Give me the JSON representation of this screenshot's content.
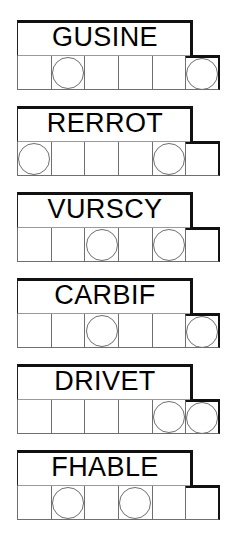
{
  "sheet": {
    "title": "word-scramble-worksheet",
    "row_count": 6,
    "cells_per_row": 6,
    "banner_cell_span": 5,
    "ink_color": "#111111",
    "grid_line_color": "#6f6f6f",
    "paper_color": "#ffffff"
  },
  "rows": [
    {
      "id": "row-1",
      "word": "GUSINE",
      "circled_positions": [
        2,
        6
      ],
      "cells": [
        {
          "index": 1,
          "circled": false
        },
        {
          "index": 2,
          "circled": true
        },
        {
          "index": 3,
          "circled": false
        },
        {
          "index": 4,
          "circled": false
        },
        {
          "index": 5,
          "circled": false
        },
        {
          "index": 6,
          "circled": true
        }
      ]
    },
    {
      "id": "row-2",
      "word": "RERROT",
      "circled_positions": [
        1,
        5
      ],
      "cells": [
        {
          "index": 1,
          "circled": true
        },
        {
          "index": 2,
          "circled": false
        },
        {
          "index": 3,
          "circled": false
        },
        {
          "index": 4,
          "circled": false
        },
        {
          "index": 5,
          "circled": true
        },
        {
          "index": 6,
          "circled": false
        }
      ]
    },
    {
      "id": "row-3",
      "word": "VURSCY",
      "circled_positions": [
        3,
        5
      ],
      "cells": [
        {
          "index": 1,
          "circled": false
        },
        {
          "index": 2,
          "circled": false
        },
        {
          "index": 3,
          "circled": true
        },
        {
          "index": 4,
          "circled": false
        },
        {
          "index": 5,
          "circled": true
        },
        {
          "index": 6,
          "circled": false
        }
      ]
    },
    {
      "id": "row-4",
      "word": "CARBIF",
      "circled_positions": [
        3,
        6
      ],
      "cells": [
        {
          "index": 1,
          "circled": false
        },
        {
          "index": 2,
          "circled": false
        },
        {
          "index": 3,
          "circled": true
        },
        {
          "index": 4,
          "circled": false
        },
        {
          "index": 5,
          "circled": false
        },
        {
          "index": 6,
          "circled": true
        }
      ]
    },
    {
      "id": "row-5",
      "word": "DRIVET",
      "circled_positions": [
        5,
        6
      ],
      "cells": [
        {
          "index": 1,
          "circled": false
        },
        {
          "index": 2,
          "circled": false
        },
        {
          "index": 3,
          "circled": false
        },
        {
          "index": 4,
          "circled": false
        },
        {
          "index": 5,
          "circled": true
        },
        {
          "index": 6,
          "circled": true
        }
      ]
    },
    {
      "id": "row-6",
      "word": "FHABLE",
      "circled_positions": [
        2,
        4
      ],
      "cells": [
        {
          "index": 1,
          "circled": false
        },
        {
          "index": 2,
          "circled": true
        },
        {
          "index": 3,
          "circled": false
        },
        {
          "index": 4,
          "circled": true
        },
        {
          "index": 5,
          "circled": false
        },
        {
          "index": 6,
          "circled": false
        }
      ]
    }
  ]
}
